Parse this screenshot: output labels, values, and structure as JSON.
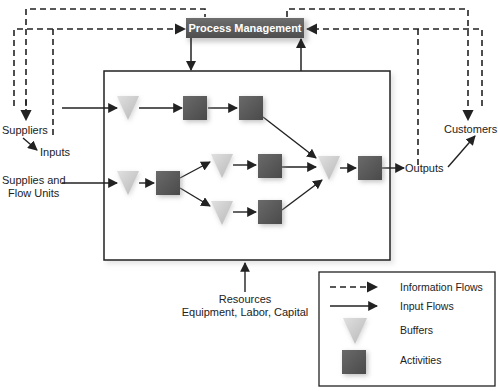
{
  "diagram": {
    "process_management": "Process Management",
    "labels": {
      "suppliers": "Suppliers",
      "inputs": "Inputs",
      "supplies_line1": "Supplies and",
      "supplies_line2": "Flow Units",
      "outputs": "Outputs",
      "customers": "Customers",
      "resources_line1": "Resources",
      "resources_line2": "Equipment, Labor, Capital"
    },
    "legend": [
      {
        "symbol": "dashed-arrow",
        "label": "Information Flows"
      },
      {
        "symbol": "solid-arrow",
        "label": "Input Flows"
      },
      {
        "symbol": "buffer-triangle",
        "label": "Buffers"
      },
      {
        "symbol": "activity-square",
        "label": "Activities"
      }
    ],
    "colors": {
      "activity": "#555555",
      "buffer": "#c8c8c8",
      "process_management": "#5a5a5a",
      "line": "#222222"
    }
  }
}
